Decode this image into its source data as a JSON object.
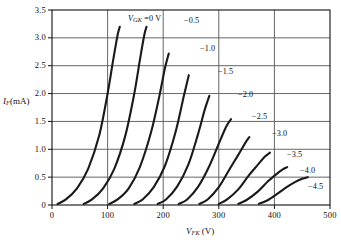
{
  "chart_data": {
    "type": "line",
    "title": "",
    "xlabel": "V_FK (V)",
    "ylabel": "I_F (mA)",
    "xlim": [
      0,
      500
    ],
    "ylim": [
      0,
      3.5
    ],
    "xticks": [
      "0",
      "100",
      "200",
      "300",
      "400",
      "500"
    ],
    "yticks": [
      "0",
      "0.5",
      "1.0",
      "1.5",
      "2.0",
      "2.5",
      "3.0",
      "3.5"
    ],
    "grid": true,
    "legend_position": "inline-curve-labels",
    "series_param_name": "V_GK",
    "series_param_unit": "V",
    "series": [
      {
        "name": "0",
        "label": "V_GK = 0 V",
        "x": [
          10,
          25,
          45,
          65,
          85,
          100,
          110,
          118,
          122
        ],
        "values": [
          0.02,
          0.1,
          0.3,
          0.65,
          1.25,
          2.0,
          2.6,
          3.05,
          3.2
        ]
      },
      {
        "name": "-0.5",
        "label": "−0.5",
        "x": [
          57,
          72,
          92,
          112,
          132,
          148,
          158,
          166,
          170
        ],
        "values": [
          0.02,
          0.1,
          0.3,
          0.65,
          1.25,
          2.0,
          2.6,
          3.05,
          3.2
        ]
      },
      {
        "name": "-1.0",
        "label": "−1.0",
        "x": [
          103,
          118,
          138,
          158,
          178,
          193,
          203,
          210
        ],
        "values": [
          0.02,
          0.1,
          0.3,
          0.68,
          1.3,
          1.95,
          2.45,
          2.72
        ]
      },
      {
        "name": "-1.5",
        "label": "−1.5",
        "x": [
          148,
          163,
          183,
          203,
          222,
          237,
          246
        ],
        "values": [
          0.02,
          0.1,
          0.32,
          0.7,
          1.3,
          1.95,
          2.33
        ]
      },
      {
        "name": "-2.0",
        "label": "−2.0",
        "x": [
          190,
          205,
          225,
          245,
          262,
          275,
          283
        ],
        "values": [
          0.02,
          0.1,
          0.33,
          0.72,
          1.25,
          1.72,
          1.96
        ]
      },
      {
        "name": "-2.5",
        "label": "−2.5",
        "x": [
          228,
          243,
          263,
          283,
          300,
          313,
          322
        ],
        "values": [
          0.02,
          0.1,
          0.33,
          0.7,
          1.1,
          1.4,
          1.54
        ]
      },
      {
        "name": "-3.0",
        "label": "−3.0",
        "x": [
          265,
          280,
          300,
          318,
          335,
          348,
          355
        ],
        "values": [
          0.02,
          0.1,
          0.32,
          0.62,
          0.9,
          1.12,
          1.22
        ]
      },
      {
        "name": "-3.5",
        "label": "−3.5",
        "x": [
          300,
          315,
          335,
          353,
          370,
          383,
          392
        ],
        "values": [
          0.02,
          0.1,
          0.28,
          0.52,
          0.72,
          0.87,
          0.94
        ]
      },
      {
        "name": "-4.0",
        "label": "−4.0",
        "x": [
          335,
          350,
          370,
          388,
          403,
          415,
          423
        ],
        "values": [
          0.02,
          0.09,
          0.24,
          0.42,
          0.55,
          0.64,
          0.68
        ]
      },
      {
        "name": "-4.5",
        "label": "−4.5",
        "x": [
          372,
          387,
          405,
          422,
          437,
          450,
          460
        ],
        "values": [
          0.02,
          0.08,
          0.2,
          0.32,
          0.41,
          0.47,
          0.5
        ]
      }
    ],
    "curve_label_positions": [
      {
        "name": "0",
        "text": "V_GK = 0 V",
        "x": 128,
        "y": 14
      },
      {
        "name": "-0.5",
        "text": "−0.5",
        "x": 184,
        "y": 16
      },
      {
        "name": "-1.0",
        "text": "−1.0",
        "x": 200,
        "y": 44
      },
      {
        "name": "-1.5",
        "text": "−1.5",
        "x": 218,
        "y": 67
      },
      {
        "name": "-2.0",
        "text": "−2.0",
        "x": 238,
        "y": 90
      },
      {
        "name": "-2.5",
        "text": "−2.5",
        "x": 252,
        "y": 112
      },
      {
        "name": "-3.0",
        "text": "−3.0",
        "x": 272,
        "y": 129
      },
      {
        "name": "-3.5",
        "text": "−3.5",
        "x": 287,
        "y": 150
      },
      {
        "name": "-4.0",
        "text": "−4.0",
        "x": 300,
        "y": 166
      },
      {
        "name": "-4.5",
        "text": "−4.5",
        "x": 308,
        "y": 182
      }
    ]
  },
  "axis": {
    "y_label_main": "I",
    "y_label_sub": "F",
    "y_label_unit": "(mA)",
    "x_label_main": "V",
    "x_label_sub": "FK",
    "x_label_unit": "(V)"
  },
  "colors": {
    "curve": "#1a1a1a",
    "grid": "#555555",
    "frame": "#111111",
    "background": "#ffffff",
    "text": "#111111"
  }
}
